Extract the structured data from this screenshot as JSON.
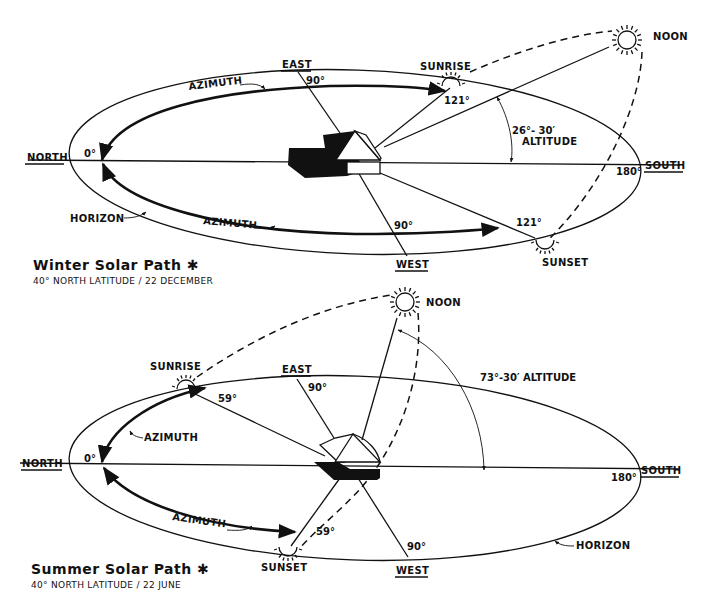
{
  "winter": {
    "title": "Winter Solar Path ✱",
    "subtitle": "40° NORTH LATITUDE / 22 DECEMBER",
    "directions": {
      "north": "NORTH",
      "east": "EAST",
      "south": "SOUTH",
      "west": "WEST"
    },
    "events": {
      "sunrise": "SUNRISE",
      "noon": "NOON",
      "sunset": "SUNSET"
    },
    "labels": {
      "azimuth_top": "AZIMUTH",
      "azimuth_bottom": "AZIMUTH",
      "horizon": "HORIZON"
    },
    "angles": {
      "north": "0°",
      "east": "90°",
      "west": "90°",
      "south": "180°",
      "sunrise_azimuth": "121°",
      "sunset_azimuth": "121°",
      "altitude_value": "26°- 30′",
      "altitude_word": "ALTITUDE"
    }
  },
  "summer": {
    "title": "Summer Solar Path ✱",
    "subtitle": "40° NORTH LATITUDE / 22 JUNE",
    "directions": {
      "north": "NORTH",
      "east": "EAST",
      "south": "SOUTH",
      "west": "WEST"
    },
    "events": {
      "sunrise": "SUNRISE",
      "noon": "NOON",
      "sunset": "SUNSET"
    },
    "labels": {
      "azimuth_top": "AZIMUTH",
      "azimuth_bottom": "AZIMUTH",
      "horizon": "HORIZON"
    },
    "angles": {
      "north": "0°",
      "east": "90°",
      "west": "90°",
      "south": "180°",
      "sunrise_azimuth": "59°",
      "sunset_azimuth": "59°",
      "altitude": "73°-30′ ALTITUDE"
    }
  }
}
